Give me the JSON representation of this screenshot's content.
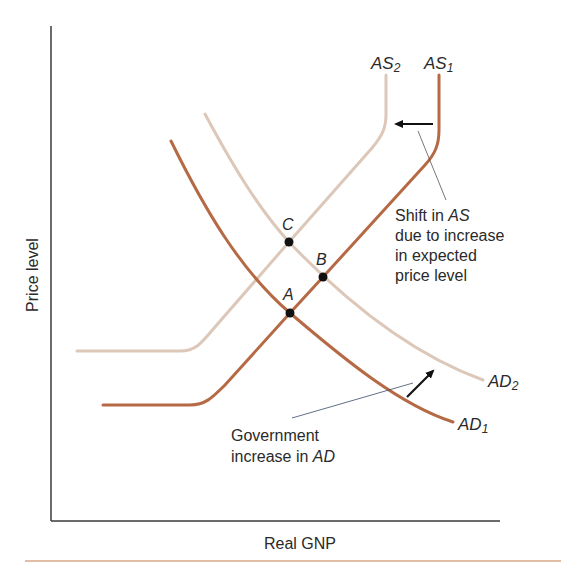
{
  "diagram": {
    "x_axis_label": "Real GNP",
    "y_axis_label": "Price level",
    "colors": {
      "original_curves": "#b56a45",
      "shifted_curves": "#dcc7b9",
      "axes": "#3a3a3a",
      "points": "#111111",
      "arrows": "#111111",
      "bottom_rule": "#d9a98a"
    },
    "curves": {
      "as1": {
        "name": "AS",
        "sub": "1"
      },
      "as2": {
        "name": "AS",
        "sub": "2"
      },
      "ad1": {
        "name": "AD",
        "sub": "1"
      },
      "ad2": {
        "name": "AD",
        "sub": "2"
      }
    },
    "points": {
      "a": "A",
      "b": "B",
      "c": "C"
    },
    "annotations": {
      "as_shift": {
        "line1_prefix": "Shift in ",
        "line1_ital": "AS",
        "line2": "due to increase",
        "line3": "in expected",
        "line4": "price level"
      },
      "ad_shift": {
        "line1": "Government",
        "line2_prefix": "increase in ",
        "line2_ital": "AD"
      }
    }
  }
}
